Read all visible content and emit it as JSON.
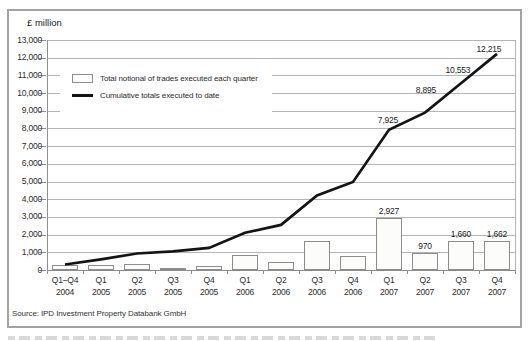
{
  "figure": {
    "unit_label": "£ million",
    "source": "Source: IPD Investment Property Databank GmbH"
  },
  "chart_data": {
    "type": "combo-bar-line",
    "title": "",
    "ylabel": "£ million",
    "xlabel": "",
    "ylim": [
      0,
      13000
    ],
    "ytick_step": 1000,
    "y_tick_labels": [
      "0",
      "1,000",
      "2,000",
      "3,000",
      "4,000",
      "5,000",
      "6,000",
      "7,000",
      "8,000",
      "9,000",
      "10,000",
      "11,000",
      "12,000",
      "13,000"
    ],
    "grid": "horizontal",
    "legend_position": "upper-left-inside",
    "categories": [
      {
        "quarter": "Q1–Q4",
        "year": "2004"
      },
      {
        "quarter": "Q1",
        "year": "2005"
      },
      {
        "quarter": "Q2",
        "year": "2005"
      },
      {
        "quarter": "Q3",
        "year": "2005"
      },
      {
        "quarter": "Q4",
        "year": "2005"
      },
      {
        "quarter": "Q1",
        "year": "2006"
      },
      {
        "quarter": "Q2",
        "year": "2006"
      },
      {
        "quarter": "Q3",
        "year": "2006"
      },
      {
        "quarter": "Q4",
        "year": "2006"
      },
      {
        "quarter": "Q1",
        "year": "2007"
      },
      {
        "quarter": "Q2",
        "year": "2007"
      },
      {
        "quarter": "Q3",
        "year": "2007"
      },
      {
        "quarter": "Q4",
        "year": "2007"
      }
    ],
    "series": [
      {
        "name": "Total notional of trades executed each quarter",
        "type": "bar",
        "values": [
          310,
          290,
          330,
          120,
          200,
          850,
          450,
          1660,
          770,
          2927,
          970,
          1660,
          1662
        ],
        "value_labels": [
          null,
          null,
          null,
          null,
          null,
          null,
          null,
          null,
          null,
          "2,927",
          "970",
          "1,660",
          "1,662"
        ]
      },
      {
        "name": "Cumulative totals executed to date",
        "type": "line",
        "values": [
          310,
          600,
          930,
          1050,
          1250,
          2100,
          2550,
          4210,
          4980,
          7925,
          8895,
          10553,
          12215
        ],
        "value_labels": [
          null,
          null,
          null,
          null,
          null,
          null,
          null,
          null,
          null,
          "7,925",
          "8,895",
          "10,553",
          "12,215"
        ]
      }
    ]
  },
  "colors": {
    "line": "#141414",
    "bar_fill": "#fcfcfb",
    "bar_border": "#8c8c8c",
    "gridline": "#b5b5b5",
    "frame": "#a3a3a3",
    "text": "#2b2b2b"
  }
}
